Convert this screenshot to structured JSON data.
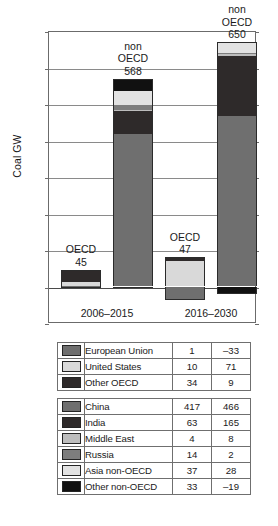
{
  "chart_data": {
    "type": "bar",
    "subtype": "stacked-bar-grouped",
    "title": "",
    "xlabel": "",
    "ylabel": "Coal GW",
    "ylim": [
      -100,
      700
    ],
    "ytick_values": [
      700,
      600,
      500,
      400,
      300,
      200,
      100,
      0,
      -100
    ],
    "ytick_labels": [
      "700",
      "600",
      "500",
      "400",
      "300",
      "200",
      "100",
      "0",
      "-100"
    ],
    "grid": true,
    "legend_position": "below-chart",
    "categories": [
      "2006-2015",
      "2016-2030"
    ],
    "category_labels": [
      "2006–2015",
      "2016–2030"
    ],
    "groups": [
      {
        "name": "OECD",
        "annotation_label": "OECD",
        "totals": [
          45,
          47
        ],
        "total_labels": [
          "45",
          "47"
        ]
      },
      {
        "name": "non OECD",
        "annotation_label": "non\nOECD",
        "totals": [
          568,
          650
        ],
        "total_labels": [
          "568",
          "650"
        ]
      }
    ],
    "oecd_series": [
      {
        "name": "European Union",
        "color": "#6f6f6f",
        "values": [
          1,
          -33
        ],
        "value_labels": [
          "1",
          "–33"
        ]
      },
      {
        "name": "United States",
        "color": "#d9d9d9",
        "values": [
          10,
          71
        ],
        "value_labels": [
          "10",
          "71"
        ]
      },
      {
        "name": "Other OECD",
        "color": "#2e2a2a",
        "values": [
          34,
          9
        ],
        "value_labels": [
          "34",
          "9"
        ]
      }
    ],
    "non_oecd_series": [
      {
        "name": "China",
        "color": "#6f6f6f",
        "values": [
          417,
          466
        ],
        "value_labels": [
          "417",
          "466"
        ]
      },
      {
        "name": "India",
        "color": "#2e2a2a",
        "values": [
          63,
          165
        ],
        "value_labels": [
          "63",
          "165"
        ]
      },
      {
        "name": "Middle East",
        "color": "#bdbdbd",
        "values": [
          4,
          8
        ],
        "value_labels": [
          "4",
          "8"
        ]
      },
      {
        "name": "Russia",
        "color": "#7d7d7d",
        "values": [
          14,
          2
        ],
        "value_labels": [
          "14",
          "2"
        ]
      },
      {
        "name": "Asia non-OECD",
        "color": "#e2e2e2",
        "values": [
          37,
          28
        ],
        "value_labels": [
          "37",
          "28"
        ]
      },
      {
        "name": "Other non-OECD",
        "color": "#111111",
        "values": [
          33,
          -19
        ],
        "value_labels": [
          "33",
          "–19"
        ]
      }
    ],
    "annotations": [
      {
        "text": "OECD",
        "value": "45",
        "for": "oecd-2006-2015"
      },
      {
        "text": "non OECD",
        "value": "568",
        "for": "nonoecd-2006-2015"
      },
      {
        "text": "OECD",
        "value": "47",
        "for": "oecd-2016-2030"
      },
      {
        "text": "non OECD",
        "value": "650",
        "for": "nonoecd-2016-2030"
      }
    ]
  },
  "axis": {
    "y_title": "Coal GW",
    "y_ticks": [
      "700",
      "600",
      "500",
      "400",
      "300",
      "200",
      "100",
      "0",
      "−100"
    ],
    "x_ticks": [
      "2006–2015",
      "2016–2030"
    ]
  },
  "bar_labels": {
    "b1_line1": "OECD",
    "b1_line2": "45",
    "b2_line1": "non",
    "b2_line2": "OECD",
    "b2_line3": "568",
    "b3_line1": "OECD",
    "b3_line2": "47",
    "b4_line1": "non",
    "b4_line2": "OECD",
    "b4_line3": "650"
  },
  "legend": {
    "oecd_table": {
      "rows": [
        {
          "swatch": "#6f6f6f",
          "label": "European Union",
          "col1": "1",
          "col2": "–33"
        },
        {
          "swatch": "#d9d9d9",
          "label": "United States",
          "col1": "10",
          "col2": "71"
        },
        {
          "swatch": "#2e2a2a",
          "label": "Other OECD",
          "col1": "34",
          "col2": "9"
        }
      ]
    },
    "non_oecd_table": {
      "rows": [
        {
          "swatch": "#6f6f6f",
          "label": "China",
          "col1": "417",
          "col2": "466"
        },
        {
          "swatch": "#2e2a2a",
          "label": "India",
          "col1": "63",
          "col2": "165"
        },
        {
          "swatch": "#bdbdbd",
          "label": "Middle East",
          "col1": "4",
          "col2": "8"
        },
        {
          "swatch": "#7d7d7d",
          "label": "Russia",
          "col1": "14",
          "col2": "2"
        },
        {
          "swatch": "#e2e2e2",
          "label": "Asia non-OECD",
          "col1": "37",
          "col2": "28"
        },
        {
          "swatch": "#111111",
          "label": "Other non-OECD",
          "col1": "33",
          "col2": "–19"
        }
      ]
    }
  },
  "colors": {
    "axis": "#6b6b6b",
    "grid": "#8a8a8a",
    "text": "#1a1a1a",
    "background": "#ffffff"
  }
}
